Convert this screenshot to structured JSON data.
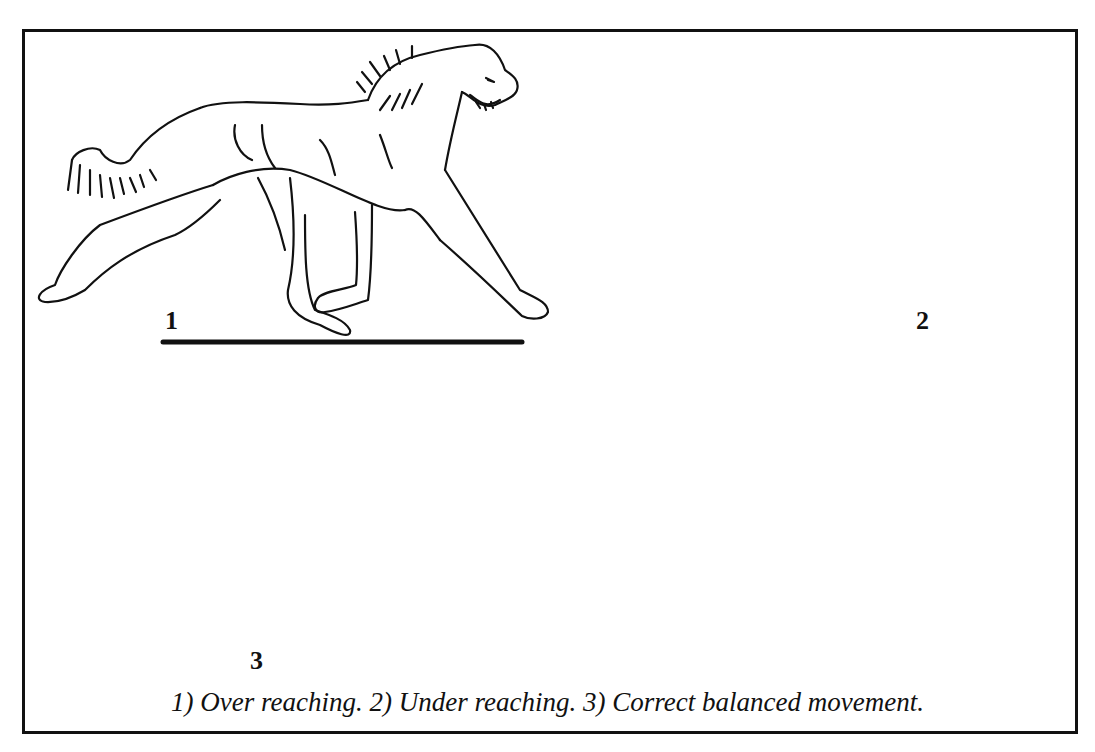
{
  "figure": {
    "panels": [
      {
        "number": "1",
        "description": "Over reaching"
      },
      {
        "number": "2",
        "description": "Under reaching"
      },
      {
        "number": "3",
        "description": "Correct balanced movement"
      }
    ],
    "caption": "1) Over reaching. 2) Under reaching. 3) Correct balanced movement.",
    "line_color": "#111111",
    "background": "#ffffff"
  }
}
